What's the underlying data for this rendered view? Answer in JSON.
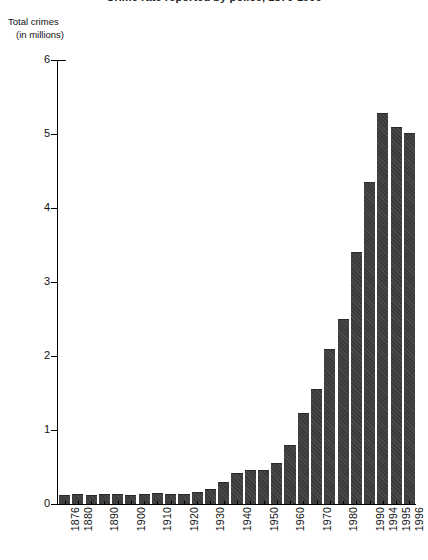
{
  "chart": {
    "title": "Crime rate reported by police, 1876-1996",
    "y_axis_caption_line1": "Total crimes",
    "y_axis_caption_line2": "(in millions)"
  },
  "chart_data": {
    "type": "bar",
    "title": "Crime rate reported by police, 1876-1996",
    "xlabel": "",
    "ylabel": "Total crimes (in millions)",
    "ylim": [
      0,
      6
    ],
    "yticks": [
      0,
      1,
      2,
      3,
      4,
      5,
      6
    ],
    "ytick_labels": [
      "0",
      "1",
      "2",
      "3",
      "4",
      "5",
      "6"
    ],
    "grid": false,
    "legend": null,
    "bar_color": "#3b3b3b",
    "categories": [
      "1876",
      "1880",
      "1885",
      "1890",
      "1895",
      "1900",
      "1905",
      "1910",
      "1915",
      "1920",
      "1925",
      "1930",
      "1935",
      "1940",
      "1945",
      "1950",
      "1955",
      "1960",
      "1965",
      "1970",
      "1975",
      "1980",
      "1985",
      "1990",
      "1994",
      "1995",
      "1996"
    ],
    "tick_labels": [
      "1876",
      "1880",
      "1890",
      "1900",
      "1910",
      "1920",
      "1930",
      "1940",
      "1950",
      "1960",
      "1970",
      "1980",
      "1990",
      "1994",
      "1995",
      "1996"
    ],
    "values": [
      0.12,
      0.13,
      0.12,
      0.13,
      0.13,
      0.12,
      0.14,
      0.15,
      0.13,
      0.13,
      0.16,
      0.2,
      0.3,
      0.42,
      0.46,
      0.46,
      0.55,
      0.8,
      1.23,
      1.55,
      2.1,
      2.5,
      3.41,
      4.35,
      5.28,
      5.09,
      5.02
    ],
    "labelled_bars": [
      {
        "label": "1876",
        "value": 0.12
      },
      {
        "label": "1880",
        "value": 0.13
      },
      {
        "label": "1890",
        "value": 0.13
      },
      {
        "label": "1900",
        "value": 0.12
      },
      {
        "label": "1910",
        "value": 0.15
      },
      {
        "label": "1920",
        "value": 0.13
      },
      {
        "label": "1930",
        "value": 0.2
      },
      {
        "label": "1940",
        "value": 0.42
      },
      {
        "label": "1950",
        "value": 0.46
      },
      {
        "label": "1960",
        "value": 0.8
      },
      {
        "label": "1970",
        "value": 1.55
      },
      {
        "label": "1980",
        "value": 2.5
      },
      {
        "label": "1990",
        "value": 4.35
      },
      {
        "label": "1994",
        "value": 5.28
      },
      {
        "label": "1995",
        "value": 5.09
      },
      {
        "label": "1996",
        "value": 5.02
      }
    ]
  }
}
